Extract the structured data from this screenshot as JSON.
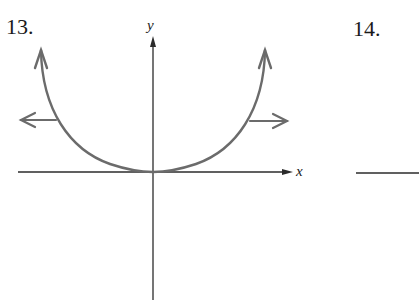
{
  "problems": [
    {
      "number": "13.",
      "axes": {
        "x_label": "x",
        "y_label": "y"
      },
      "curve": {
        "description": "U-shaped curve with vertex at origin, tangent to x-axis, rising steeply on both sides",
        "color": "#6b6b6b",
        "end_arrows": [
          "up-left",
          "up-right"
        ]
      },
      "horizontal_arrows": [
        {
          "direction": "left",
          "color": "#6b6b6b"
        },
        {
          "direction": "right",
          "color": "#6b6b6b"
        }
      ]
    },
    {
      "number": "14.",
      "axes": {
        "x_label": "",
        "y_label": ""
      }
    }
  ],
  "colors": {
    "axis": "#2b2b2b",
    "curve": "#6b6b6b",
    "text": "#1a1a1a"
  }
}
